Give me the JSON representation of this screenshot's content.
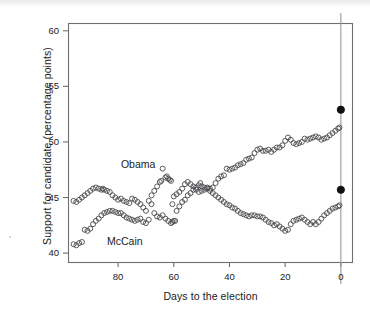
{
  "figure": {
    "background_color": "#ffffff",
    "plot_frame_color": "#6f6f72",
    "marker_stroke_color": "#4a4a4d",
    "election_line_color": "#9a9a9d",
    "final_dot_color": "#111111"
  },
  "chart_data": {
    "type": "scatter",
    "title": "",
    "xlabel": "Days to the election",
    "ylabel": "Support for candidate (percentage points)",
    "xlim": [
      98,
      -4
    ],
    "ylim": [
      39.2,
      60.7
    ],
    "xticks": [
      80,
      60,
      40,
      20,
      0
    ],
    "xtick_labels": [
      "80",
      "60",
      "40",
      "20",
      "0"
    ],
    "yticks": [
      40,
      45,
      50,
      55,
      60
    ],
    "ytick_labels": [
      "40",
      "45",
      "50",
      "55",
      "60"
    ],
    "grid": false,
    "legend_position": "inline-annotations",
    "x_axis_direction": "reversed",
    "annotations": [
      {
        "text": "Obama",
        "x": 79,
        "y": 47.9
      },
      {
        "text": "McCain",
        "x": 84,
        "y": 41.0
      }
    ],
    "reference_line": {
      "name": "election-day-line",
      "x": 0,
      "orientation": "vertical"
    },
    "final_results": [
      {
        "name": "Obama",
        "x": 0,
        "y": 52.9
      },
      {
        "name": "McCain",
        "x": 0,
        "y": 45.7
      }
    ],
    "series": [
      {
        "name": "Obama",
        "marker": "open-circle",
        "points": [
          [
            96.0,
            44.7
          ],
          [
            95.0,
            44.6
          ],
          [
            94.0,
            44.8
          ],
          [
            93.0,
            45.0
          ],
          [
            92.0,
            45.2
          ],
          [
            91.0,
            45.4
          ],
          [
            90.0,
            45.6
          ],
          [
            89.0,
            45.8
          ],
          [
            88.0,
            45.9
          ],
          [
            87.0,
            45.8
          ],
          [
            86.0,
            45.7
          ],
          [
            85.5,
            45.8
          ],
          [
            85.0,
            45.7
          ],
          [
            84.0,
            45.6
          ],
          [
            83.0,
            45.5
          ],
          [
            82.0,
            45.2
          ],
          [
            81.0,
            45.0
          ],
          [
            80.0,
            44.8
          ],
          [
            79.0,
            44.9
          ],
          [
            78.0,
            44.7
          ],
          [
            77.0,
            44.6
          ],
          [
            76.0,
            44.5
          ],
          [
            75.0,
            44.9
          ],
          [
            74.0,
            44.8
          ],
          [
            73.0,
            44.6
          ],
          [
            72.0,
            44.4
          ],
          [
            71.0,
            44.1
          ],
          [
            70.0,
            43.8
          ],
          [
            69.0,
            44.7
          ],
          [
            68.0,
            45.2
          ],
          [
            67.0,
            45.6
          ],
          [
            66.0,
            46.0
          ],
          [
            65.0,
            46.4
          ],
          [
            64.5,
            46.5
          ],
          [
            64.0,
            47.6
          ],
          [
            63.0,
            46.8
          ],
          [
            62.5,
            46.9
          ],
          [
            62.0,
            46.7
          ],
          [
            61.5,
            46.6
          ],
          [
            61.0,
            46.5
          ],
          [
            60.5,
            44.4
          ],
          [
            60.0,
            45.1
          ],
          [
            59.0,
            45.3
          ],
          [
            58.0,
            45.5
          ],
          [
            57.0,
            45.8
          ],
          [
            56.0,
            46.2
          ],
          [
            55.0,
            46.4
          ],
          [
            54.0,
            46.2
          ],
          [
            53.0,
            46.0
          ],
          [
            52.0,
            45.7
          ],
          [
            51.0,
            45.5
          ],
          [
            50.0,
            45.6
          ],
          [
            49.0,
            45.7
          ],
          [
            48.0,
            45.9
          ],
          [
            47.0,
            45.8
          ],
          [
            46.0,
            45.9
          ],
          [
            45.0,
            46.3
          ],
          [
            44.0,
            46.7
          ],
          [
            43.0,
            46.9
          ],
          [
            42.0,
            47.0
          ],
          [
            41.0,
            47.6
          ],
          [
            40.0,
            47.5
          ],
          [
            39.0,
            47.6
          ],
          [
            38.0,
            47.7
          ],
          [
            37.0,
            47.9
          ],
          [
            36.0,
            48.0
          ],
          [
            35.0,
            48.1
          ],
          [
            34.0,
            48.4
          ],
          [
            33.0,
            48.5
          ],
          [
            32.0,
            48.6
          ],
          [
            31.0,
            49.0
          ],
          [
            30.0,
            49.3
          ],
          [
            29.0,
            49.4
          ],
          [
            28.0,
            49.2
          ],
          [
            27.0,
            49.2
          ],
          [
            26.0,
            49.3
          ],
          [
            25.0,
            49.1
          ],
          [
            24.0,
            49.3
          ],
          [
            23.0,
            49.5
          ],
          [
            22.0,
            49.5
          ],
          [
            21.0,
            49.7
          ],
          [
            20.0,
            50.1
          ],
          [
            19.0,
            50.4
          ],
          [
            18.0,
            50.2
          ],
          [
            17.0,
            49.9
          ],
          [
            16.0,
            49.8
          ],
          [
            15.0,
            49.9
          ],
          [
            14.0,
            50.0
          ],
          [
            13.0,
            50.3
          ],
          [
            12.0,
            50.2
          ],
          [
            11.0,
            50.3
          ],
          [
            10.0,
            50.4
          ],
          [
            9.0,
            50.5
          ],
          [
            8.0,
            50.4
          ],
          [
            7.0,
            50.2
          ],
          [
            6.0,
            50.3
          ],
          [
            5.0,
            50.4
          ],
          [
            4.0,
            50.6
          ],
          [
            3.0,
            50.8
          ],
          [
            2.0,
            51.0
          ],
          [
            1.0,
            51.2
          ],
          [
            0.5,
            51.3
          ]
        ]
      },
      {
        "name": "McCain",
        "marker": "open-circle",
        "points": [
          [
            96.0,
            40.8
          ],
          [
            95.0,
            40.7
          ],
          [
            94.0,
            40.9
          ],
          [
            93.0,
            41.0
          ],
          [
            92.0,
            42.1
          ],
          [
            91.0,
            42.0
          ],
          [
            90.0,
            42.2
          ],
          [
            89.0,
            42.6
          ],
          [
            88.0,
            42.9
          ],
          [
            87.0,
            43.1
          ],
          [
            86.0,
            43.4
          ],
          [
            85.0,
            43.6
          ],
          [
            84.0,
            43.7
          ],
          [
            83.0,
            43.8
          ],
          [
            82.0,
            43.8
          ],
          [
            81.0,
            43.7
          ],
          [
            80.0,
            43.6
          ],
          [
            79.0,
            43.6
          ],
          [
            78.0,
            43.4
          ],
          [
            77.0,
            43.2
          ],
          [
            76.0,
            43.1
          ],
          [
            75.0,
            43.0
          ],
          [
            74.0,
            42.9
          ],
          [
            73.0,
            43.0
          ],
          [
            72.0,
            43.1
          ],
          [
            71.0,
            42.8
          ],
          [
            70.0,
            42.7
          ],
          [
            69.0,
            43.0
          ],
          [
            68.0,
            44.4
          ],
          [
            67.0,
            43.6
          ],
          [
            66.0,
            43.3
          ],
          [
            65.0,
            43.2
          ],
          [
            64.0,
            43.4
          ],
          [
            63.0,
            43.1
          ],
          [
            62.0,
            42.9
          ],
          [
            61.0,
            42.7
          ],
          [
            60.5,
            42.8
          ],
          [
            60.0,
            42.9
          ],
          [
            59.5,
            42.9
          ],
          [
            59.0,
            43.8
          ],
          [
            58.0,
            44.2
          ],
          [
            57.0,
            44.6
          ],
          [
            56.0,
            44.8
          ],
          [
            55.0,
            45.2
          ],
          [
            54.0,
            45.4
          ],
          [
            53.0,
            45.7
          ],
          [
            52.0,
            45.9
          ],
          [
            51.0,
            46.1
          ],
          [
            50.5,
            46.3
          ],
          [
            50.0,
            46.0
          ],
          [
            49.0,
            45.9
          ],
          [
            48.0,
            45.8
          ],
          [
            47.0,
            45.6
          ],
          [
            46.0,
            45.4
          ],
          [
            45.0,
            45.2
          ],
          [
            44.0,
            45.0
          ],
          [
            43.0,
            44.8
          ],
          [
            42.0,
            44.6
          ],
          [
            41.0,
            44.4
          ],
          [
            40.0,
            44.3
          ],
          [
            39.0,
            44.1
          ],
          [
            38.0,
            44.0
          ],
          [
            37.0,
            43.8
          ],
          [
            36.0,
            43.6
          ],
          [
            35.0,
            43.5
          ],
          [
            34.0,
            43.4
          ],
          [
            33.0,
            43.3
          ],
          [
            32.0,
            43.4
          ],
          [
            31.0,
            43.4
          ],
          [
            30.0,
            43.3
          ],
          [
            29.0,
            43.3
          ],
          [
            28.0,
            43.2
          ],
          [
            27.0,
            43.0
          ],
          [
            26.0,
            42.8
          ],
          [
            25.0,
            42.7
          ],
          [
            24.0,
            42.5
          ],
          [
            23.0,
            42.6
          ],
          [
            22.0,
            42.4
          ],
          [
            21.0,
            42.2
          ],
          [
            20.0,
            42.0
          ],
          [
            19.0,
            42.1
          ],
          [
            18.0,
            42.6
          ],
          [
            17.0,
            42.9
          ],
          [
            16.0,
            43.0
          ],
          [
            15.0,
            43.1
          ],
          [
            14.0,
            43.2
          ],
          [
            13.0,
            43.0
          ],
          [
            12.0,
            42.8
          ],
          [
            11.0,
            42.6
          ],
          [
            10.0,
            42.8
          ],
          [
            9.0,
            42.6
          ],
          [
            8.0,
            42.8
          ],
          [
            7.0,
            43.1
          ],
          [
            6.0,
            43.4
          ],
          [
            5.0,
            43.6
          ],
          [
            4.0,
            43.8
          ],
          [
            3.0,
            44.0
          ],
          [
            2.0,
            44.1
          ],
          [
            1.0,
            44.2
          ],
          [
            0.5,
            44.3
          ]
        ]
      }
    ]
  }
}
